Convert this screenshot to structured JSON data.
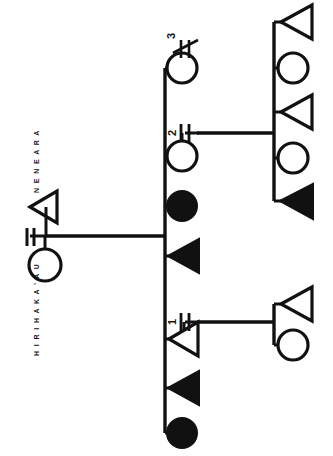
{
  "diagram": {
    "type": "kinship-genealogy-chart",
    "title": "",
    "orientation_note": "rotated-90-counterclockwise",
    "canvas": {
      "width": 333,
      "height": 456
    },
    "stroke_color": "#111111",
    "fill_color": "#111111",
    "background_color": "#ffffff",
    "symbol_legend": {
      "circle_open": "female",
      "circle_filled": "female-deceased",
      "triangle_open": "male",
      "triangle_filled": "male-deceased",
      "double_line": "marriage",
      "double_line_slashed": "marriage-dissolved"
    },
    "labels": [
      {
        "id": "label-hirihakaau",
        "text": "H I R I H A K A ' A U",
        "person": "HIRIHAKA'AU",
        "sex": "female"
      },
      {
        "id": "label-neneara",
        "text": "N E N E A R A",
        "person": "NENEARA",
        "sex": "male"
      }
    ],
    "marriage_numbers": [
      {
        "id": "marriage-num-1",
        "text": "1"
      },
      {
        "id": "marriage-num-2",
        "text": "2"
      },
      {
        "id": "marriage-num-3",
        "text": "3"
      }
    ],
    "founding_couple": {
      "female": {
        "id": "person-hirihakaau",
        "symbol": "circle_open",
        "cx": 45,
        "cy": 265,
        "r": 16
      },
      "male": {
        "id": "person-neneara",
        "symbol": "triangle_open",
        "cx": 46,
        "cy": 207,
        "size": 19
      },
      "marriage_symbol": {
        "id": "marriage-founding",
        "x": 26,
        "y": 236,
        "dissolved": false
      }
    },
    "sibling_spine": {
      "x": 165,
      "y1": 68,
      "y2": 433
    },
    "descent_from_parents": {
      "x1": 46,
      "x2": 165,
      "y": 236
    },
    "siblings": [
      {
        "id": "sib-1",
        "symbol": "circle_open",
        "cx": 182,
        "cy": 68,
        "r": 15,
        "marriage": "3",
        "marriage_dissolved": true
      },
      {
        "id": "sib-2",
        "symbol": "circle_open",
        "cx": 182,
        "cy": 156,
        "r": 15,
        "marriage": "2",
        "marriage_dissolved": false
      },
      {
        "id": "sib-3",
        "symbol": "circle_filled",
        "cx": 182,
        "cy": 206,
        "r": 15,
        "marriage": null
      },
      {
        "id": "sib-4",
        "symbol": "triangle_filled",
        "cx": 184,
        "cy": 256,
        "size": 19,
        "marriage": null
      },
      {
        "id": "sib-5",
        "symbol": "triangle_open",
        "cx": 184,
        "cy": 339,
        "size": 19,
        "marriage": "1",
        "marriage_dissolved": false
      },
      {
        "id": "sib-6",
        "symbol": "triangle_filled",
        "cx": 184,
        "cy": 388,
        "size": 19,
        "marriage": null
      },
      {
        "id": "sib-7",
        "symbol": "circle_filled",
        "cx": 182,
        "cy": 433,
        "r": 15,
        "marriage": null
      }
    ],
    "offspring_groups": [
      {
        "id": "offspring-group-marriage-2",
        "from_marriage": "2",
        "descent_line": {
          "x1": 197,
          "x2": 274,
          "y": 133
        },
        "spine": {
          "x": 274,
          "y1": 22,
          "y2": 201
        },
        "children": [
          {
            "id": "child-2-1",
            "symbol": "triangle_open",
            "cx": 296,
            "cy": 22,
            "size": 19
          },
          {
            "id": "child-2-2",
            "symbol": "circle_open",
            "cx": 293,
            "cy": 68,
            "r": 15
          },
          {
            "id": "child-2-3",
            "symbol": "triangle_open",
            "cx": 296,
            "cy": 112,
            "size": 19
          },
          {
            "id": "child-2-4",
            "symbol": "circle_open",
            "cx": 293,
            "cy": 158,
            "r": 15
          },
          {
            "id": "child-2-5",
            "symbol": "triangle_filled",
            "cx": 296,
            "cy": 201,
            "size": 19
          }
        ]
      },
      {
        "id": "offspring-group-marriage-1",
        "from_marriage": "1",
        "descent_line": {
          "x1": 197,
          "x2": 274,
          "y": 322
        },
        "spine": {
          "x": 274,
          "y1": 304,
          "y2": 345
        },
        "children": [
          {
            "id": "child-1-1",
            "symbol": "triangle_open",
            "cx": 296,
            "cy": 304,
            "size": 19
          },
          {
            "id": "child-1-2",
            "symbol": "circle_open",
            "cx": 293,
            "cy": 345,
            "r": 15
          }
        ]
      }
    ]
  }
}
